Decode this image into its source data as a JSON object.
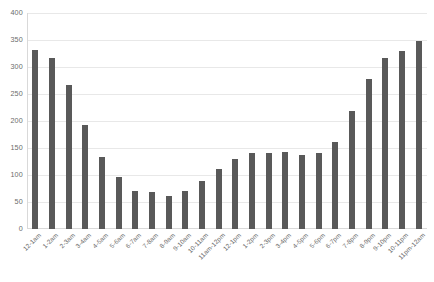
{
  "chart_data": {
    "type": "bar",
    "title": "",
    "subtitle": "",
    "xlabel": "",
    "ylabel": "",
    "ylim": [
      0,
      400
    ],
    "yticks": [
      0,
      50,
      100,
      150,
      200,
      250,
      300,
      350,
      400
    ],
    "grid": true,
    "legend": null,
    "legend_position": "none",
    "bar_color": "#595959",
    "gridline_color": "#e8e8e8",
    "axis_color": "#d9d9d9",
    "tick_label_color": "#6b6b6b",
    "x_tick_rotation": -45,
    "categories": [
      "12-1am",
      "1-2am",
      "2-3am",
      "3-4am",
      "4-5am",
      "5-6am",
      "6-7am",
      "7-8am",
      "8-9am",
      "9-10am",
      "10-11am",
      "11am-12pm",
      "12-1pm",
      "1-2pm",
      "2-3pm",
      "3-4pm",
      "4-5pm",
      "5-6pm",
      "6-7pm",
      "7-8pm",
      "8-9pm",
      "9-10pm",
      "10-11pm",
      "11pm-12am"
    ],
    "values": [
      331,
      317,
      266,
      193,
      134,
      96,
      71,
      68,
      62,
      70,
      88,
      112,
      130,
      141,
      141,
      143,
      137,
      140,
      162,
      219,
      278,
      316,
      330,
      348
    ]
  }
}
